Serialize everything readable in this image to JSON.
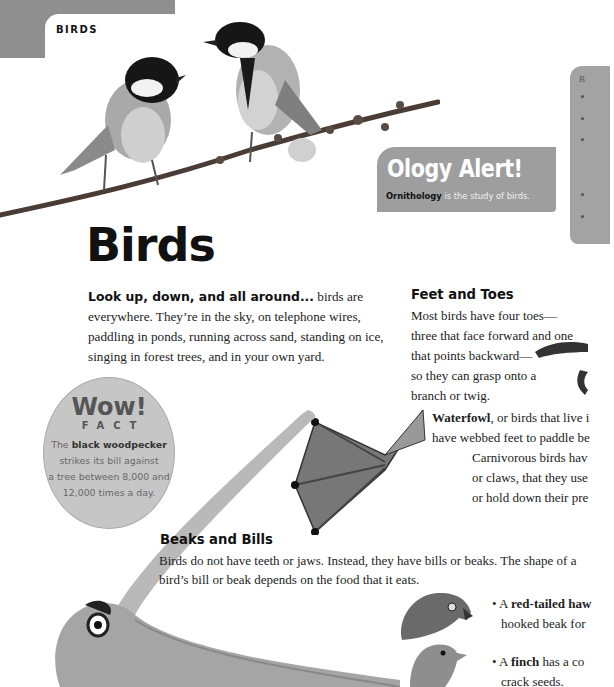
{
  "header": {
    "section_label": "BIRDS"
  },
  "ology_alert": {
    "title": "Ology Alert!",
    "term": "Ornithology",
    "definition": " is the study of birds."
  },
  "sidebar_box": {
    "label": "B",
    "bullet_count": 5
  },
  "page_title": "Birds",
  "intro": {
    "lead": "Look up, down, and all around...",
    "body": " birds are everywhere. They’re in the sky, on telephone wires, paddling in ponds, running across sand, standing on ice, singing in forest trees, and in your own yard."
  },
  "feet_and_toes": {
    "heading": "Feet and Toes",
    "lines": [
      "Most birds have four toes—",
      "three that face forward and one",
      "that points backward—",
      "so they can grasp onto a",
      "branch or twig."
    ],
    "waterfowl_term": "Waterfowl",
    "waterfowl_line1": ", or birds that live i",
    "waterfowl_line2": "have webbed feet to paddle be",
    "carnivorous_lines": [
      "Carnivorous birds hav",
      "or claws, that they use",
      "or hold down their pre"
    ]
  },
  "wow_fact": {
    "title": "Wow!",
    "subtitle": "FACT",
    "prefix": "The ",
    "term": "black woodpecker",
    "lines": [
      "strikes its bill against",
      "a tree between 8,000 and",
      "12,000 times a day."
    ]
  },
  "beaks_and_bills": {
    "heading": "Beaks and Bills",
    "lines": [
      "Birds do not have teeth or jaws. Instead, they have bills or beaks. The shape of a",
      "bird’s bill or beak depends on the food that it eats."
    ],
    "bullets": [
      {
        "prefix": "• A ",
        "term": "red-tailed haw",
        "line2": "hooked beak for"
      },
      {
        "prefix": "• A ",
        "term": "finch",
        "rest": " has a co",
        "line2": "crack seeds."
      }
    ]
  },
  "images": {
    "great_tits_on_branch": "two great tits perched on a branch",
    "duck_foot": "webbed foot illustration",
    "pelican": "pelican with long bill",
    "hawk_head": "red-tailed hawk head illustration",
    "finch_head": "finch head illustration"
  }
}
